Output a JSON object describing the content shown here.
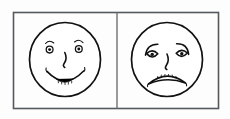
{
  "image": {
    "title": "Two hand-drawn emotion faces",
    "background_color": "#fdfdfd",
    "ink_color": "#111111",
    "frame_color": "#55595e",
    "width": 230,
    "height": 119
  },
  "panels": [
    {
      "id": "happy-panel",
      "label": "Happy face panel",
      "face": {
        "name": "smiling-face",
        "expression": "happy",
        "eyebrows": "raised arcs",
        "eyes": "round rings with dot pupils",
        "nose": "s-curve hook",
        "mouth": "upturned smile with teeth hatching"
      }
    },
    {
      "id": "sad-panel",
      "label": "Sad face panel",
      "face": {
        "name": "frowning-face",
        "expression": "sad",
        "eyebrows": "downward slanted worried brows",
        "eyes": "droopy half-lidded with dot pupils",
        "nose": "s-curve hook",
        "mouth": "downturned frown with teeth hatching"
      }
    }
  ]
}
